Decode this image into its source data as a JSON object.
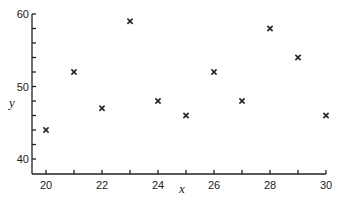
{
  "chart_data": {
    "type": "scatter",
    "title": "",
    "xlabel": "x",
    "ylabel": "y",
    "xlim": [
      20,
      30
    ],
    "ylim": [
      40,
      60
    ],
    "x_ticks": [
      20,
      22,
      24,
      26,
      28,
      30
    ],
    "x_minor_ticks": [
      21,
      23,
      25,
      27,
      29
    ],
    "y_ticks": [
      40,
      50,
      60
    ],
    "y_minor_ticks": [
      42,
      44,
      46,
      48,
      52,
      54,
      56,
      58
    ],
    "grid": false,
    "legend": null,
    "marker": "x",
    "series": [
      {
        "name": "data",
        "points": [
          {
            "x": 20,
            "y": 44
          },
          {
            "x": 21,
            "y": 52
          },
          {
            "x": 22,
            "y": 47
          },
          {
            "x": 23,
            "y": 59
          },
          {
            "x": 24,
            "y": 48
          },
          {
            "x": 25,
            "y": 46
          },
          {
            "x": 26,
            "y": 52
          },
          {
            "x": 27,
            "y": 48
          },
          {
            "x": 28,
            "y": 58
          },
          {
            "x": 29,
            "y": 54
          },
          {
            "x": 30,
            "y": 46
          }
        ]
      }
    ]
  },
  "colors": {
    "ink": "#222222",
    "background": "#ffffff"
  }
}
